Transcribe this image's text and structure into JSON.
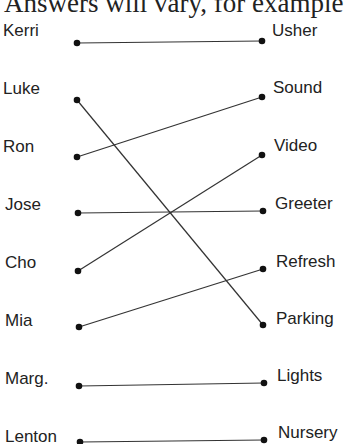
{
  "header": {
    "text": "Answers will vary, for example"
  },
  "left_items": [
    {
      "label": "Kerri",
      "y": 43
    },
    {
      "label": "Luke",
      "y": 100
    },
    {
      "label": "Ron",
      "y": 157
    },
    {
      "label": "Jose",
      "y": 213
    },
    {
      "label": "Cho",
      "y": 271
    },
    {
      "label": "Mia",
      "y": 327
    },
    {
      "label": "Marg.",
      "y": 386
    },
    {
      "label": "Lenton",
      "y": 442
    }
  ],
  "right_items": [
    {
      "label": "Usher",
      "y": 41
    },
    {
      "label": "Sound",
      "y": 97
    },
    {
      "label": "Video",
      "y": 155
    },
    {
      "label": "Greeter",
      "y": 211
    },
    {
      "label": "Refresh",
      "y": 269
    },
    {
      "label": "Parking",
      "y": 325
    },
    {
      "label": "Lights",
      "y": 383
    },
    {
      "label": "Nursery",
      "y": 440
    }
  ],
  "connections": [
    {
      "left": "Kerri",
      "right": "Usher"
    },
    {
      "left": "Luke",
      "right": "Parking"
    },
    {
      "left": "Ron",
      "right": "Sound"
    },
    {
      "left": "Jose",
      "right": "Greeter"
    },
    {
      "left": "Cho",
      "right": "Video"
    },
    {
      "left": "Mia",
      "right": "Refresh"
    },
    {
      "left": "Marg.",
      "right": "Lights"
    },
    {
      "left": "Lenton",
      "right": "Nursery"
    }
  ],
  "style": {
    "line_color": "#333333",
    "dot_color": "#111111",
    "left_dot_x": 77,
    "right_dot_x": 262
  }
}
